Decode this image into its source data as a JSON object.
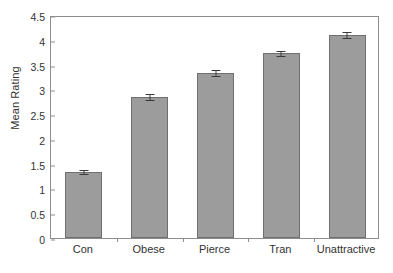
{
  "chart_data": {
    "type": "bar",
    "title": "",
    "subtitle": "",
    "xlabel": "",
    "ylabel": "Mean Rating",
    "categories": [
      "Con",
      "Obese",
      "Pierce",
      "Tran",
      "Unattractive"
    ],
    "values": [
      1.34,
      2.85,
      3.33,
      3.73,
      4.1
    ],
    "errors": [
      0.04,
      0.06,
      0.06,
      0.05,
      0.06
    ],
    "ylim": [
      0,
      4.5
    ],
    "ytick_values": [
      0,
      0.5,
      1,
      1.5,
      2,
      2.5,
      3,
      3.5,
      4,
      4.5
    ],
    "ytick_labels": [
      "0",
      "0.5",
      "1",
      "1.5",
      "2",
      "2.5",
      "3",
      "3.5",
      "4",
      "4.5"
    ],
    "grid": false,
    "legend": "none",
    "bar_color": "#9c9c9c",
    "bar_edge_color": "#6f6f6f",
    "error_bar_color": "#3a3a3a",
    "axis_color": "#8d8d8d",
    "background_color": "#ffffff",
    "annotations": []
  }
}
